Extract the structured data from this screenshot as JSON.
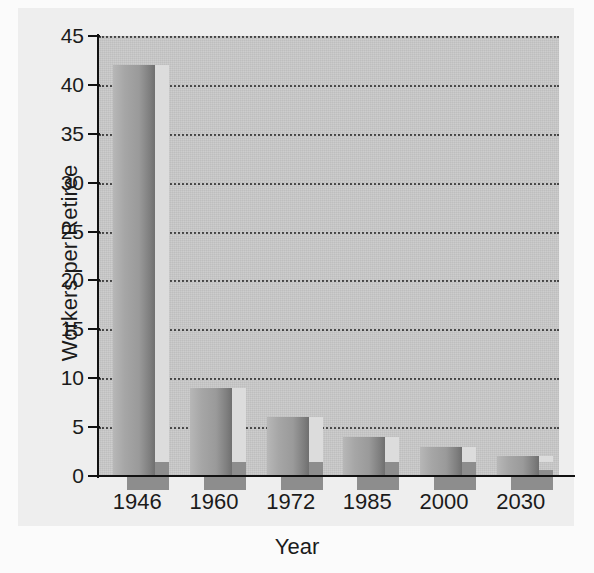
{
  "chart_data": {
    "type": "bar",
    "title": "",
    "subtitle": "",
    "xlabel": "Year",
    "ylabel": "Workers per Retiree",
    "categories": [
      "1946",
      "1960",
      "1972",
      "1985",
      "2000",
      "2030"
    ],
    "values": [
      42,
      9,
      6,
      4,
      3,
      2
    ],
    "ylim": [
      0,
      45
    ],
    "ytick_labels": [
      "45",
      "40",
      "35",
      "30",
      "25",
      "20",
      "15",
      "10",
      "5",
      "0"
    ],
    "ytick_values": [
      45,
      40,
      35,
      30,
      25,
      20,
      15,
      10,
      5,
      0
    ],
    "ytick_step": 5,
    "grid": "horizontal-dotted",
    "legend": "none",
    "series": [
      {
        "name": "Workers per Retiree",
        "values": [
          42,
          9,
          6,
          4,
          3,
          2
        ]
      }
    ],
    "annotations": []
  },
  "colors": {
    "plot_background": "#c9c9c9",
    "page_background": "#eeeeee",
    "figure_background": "#fbfbfb",
    "bar_light": "#b7b7b7",
    "bar_dark": "#6f6f6f",
    "bar_shadow": "#8d8d8d",
    "bar_top_highlight": "#dcdcdc",
    "axis": "#111111",
    "gridline": "#2e2e2e",
    "text": "#1b1b1b"
  }
}
